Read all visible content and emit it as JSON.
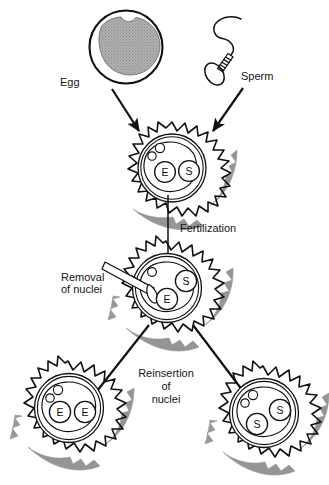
{
  "figure": {
    "background_color": "#ffffff",
    "ink_color": "#111111",
    "shade_color": "#8d8d8d",
    "egg_fill_color": "#a8a8a8"
  },
  "labels": {
    "egg": "Egg",
    "sperm": "Sperm",
    "fertilization": "Fertilization",
    "removal_line1": "Removal",
    "removal_line2": "of nuclei",
    "reinsertion_line1": "Reinsertion",
    "reinsertion_line2": "of",
    "reinsertion_line3": "nuclei"
  },
  "gametes": [
    {
      "id": "egg",
      "name": "Egg",
      "icon": "egg-cell-icon",
      "description": "Large round cell with thick outer ring and stippled gray cytoplasm"
    },
    {
      "id": "sperm",
      "name": "Sperm",
      "icon": "sperm-cell-icon",
      "description": "Oval head, ribbed midpiece and long wavy flagellum"
    }
  ],
  "cells": [
    {
      "id": "zygote-fertilized",
      "name": "fertilized-zygote",
      "stage": "Fertilization",
      "polar_bodies": 2,
      "pipette": false,
      "nuclei": [
        {
          "label": "E",
          "origin": "egg"
        },
        {
          "label": "S",
          "origin": "sperm"
        }
      ]
    },
    {
      "id": "zygote-enucleation",
      "name": "zygote-under-nuclei-removal",
      "stage": "Removal of nuclei",
      "polar_bodies": 1,
      "pipette": true,
      "nuclei": [
        {
          "label": "S",
          "origin": "sperm"
        },
        {
          "label": "E",
          "origin": "egg"
        }
      ]
    },
    {
      "id": "gynogenote",
      "name": "gynogenote-two-egg-nuclei",
      "stage": "Reinsertion of nuclei",
      "polar_bodies": 2,
      "pipette": false,
      "nuclei": [
        {
          "label": "E",
          "origin": "egg"
        },
        {
          "label": "E",
          "origin": "egg"
        }
      ]
    },
    {
      "id": "androgenote",
      "name": "androgenote-two-sperm-nuclei",
      "stage": "Reinsertion of nuclei",
      "polar_bodies": 2,
      "pipette": false,
      "nuclei": [
        {
          "label": "S",
          "origin": "sperm"
        },
        {
          "label": "S",
          "origin": "sperm"
        }
      ]
    }
  ],
  "arrows": [
    {
      "id": "egg-to-zygote",
      "name": "arrow-egg-to-zygote",
      "from": "egg",
      "to": "zygote-fertilized"
    },
    {
      "id": "sperm-to-zygote",
      "name": "arrow-sperm-to-zygote",
      "from": "sperm",
      "to": "zygote-fertilized"
    },
    {
      "id": "zygote-to-enucleation",
      "name": "arrow-fertilization",
      "from": "zygote-fertilized",
      "to": "zygote-enucleation",
      "label": "Fertilization"
    },
    {
      "id": "enucleation-to-gynogenote",
      "name": "arrow-to-gynogenote",
      "from": "zygote-enucleation",
      "to": "gynogenote"
    },
    {
      "id": "enucleation-to-androgenote",
      "name": "arrow-to-androgenote",
      "from": "zygote-enucleation",
      "to": "androgenote"
    }
  ]
}
